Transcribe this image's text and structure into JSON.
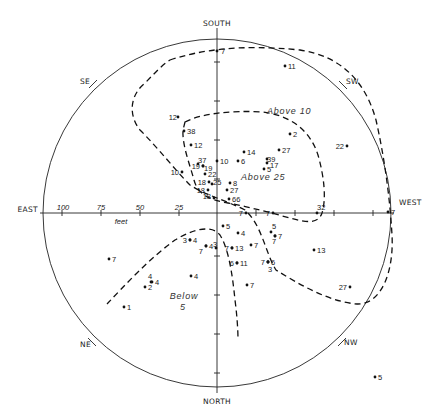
{
  "chart_data": {
    "type": "scatter",
    "title": "",
    "projection": "polar-compass",
    "center_px": [
      217,
      213
    ],
    "radius_px": 174,
    "directions": {
      "south": "SOUTH",
      "north": "NORTH",
      "east": "EAST",
      "west": "WEST",
      "se": "SE",
      "sw": "SW",
      "ne": "NE",
      "nw": "NW"
    },
    "scale": {
      "unit_label": "feet",
      "ticks": [
        "100",
        "75",
        "50",
        "25"
      ]
    },
    "contour_labels": {
      "above10": "Above 10",
      "above25": "Above 25",
      "below5_line1": "Below",
      "below5_line2": "5"
    },
    "points": [
      {
        "x": 217,
        "y": 51,
        "label": "7",
        "lx": 221,
        "ly": 54
      },
      {
        "x": 285,
        "y": 66,
        "label": "11",
        "lx": 288,
        "ly": 69
      },
      {
        "x": 178,
        "y": 117,
        "label": "12",
        "lx": 177,
        "ly": 120,
        "anchor": "end"
      },
      {
        "x": 184,
        "y": 131,
        "label": "38",
        "lx": 187,
        "ly": 134
      },
      {
        "x": 191,
        "y": 145,
        "label": "12",
        "lx": 194,
        "ly": 148
      },
      {
        "x": 290,
        "y": 134,
        "label": "2",
        "lx": 293,
        "ly": 137
      },
      {
        "x": 347,
        "y": 146,
        "label": "22",
        "lx": 344,
        "ly": 149,
        "anchor": "end"
      },
      {
        "x": 244,
        "y": 152,
        "label": "14",
        "lx": 247,
        "ly": 155
      },
      {
        "x": 279,
        "y": 150,
        "label": "27",
        "lx": 282,
        "ly": 153
      },
      {
        "x": 198,
        "y": 164,
        "label": "37",
        "lx": 198,
        "ly": 163
      },
      {
        "x": 217,
        "y": 161,
        "label": "10",
        "lx": 220,
        "ly": 164
      },
      {
        "x": 238,
        "y": 161,
        "label": "6",
        "lx": 241,
        "ly": 164
      },
      {
        "x": 267,
        "y": 159,
        "label": "39",
        "lx": 267,
        "ly": 162
      },
      {
        "x": 267,
        "y": 163,
        "label": "17",
        "lx": 270,
        "ly": 168
      },
      {
        "x": 203,
        "y": 166,
        "label": "19",
        "lx": 200,
        "ly": 169,
        "anchor": "end"
      },
      {
        "x": 203,
        "y": 166,
        "label": "19",
        "lx": 204,
        "ly": 171
      },
      {
        "x": 182,
        "y": 172,
        "label": "10",
        "lx": 179,
        "ly": 175,
        "anchor": "end"
      },
      {
        "x": 205,
        "y": 174,
        "label": "22",
        "lx": 208,
        "ly": 177
      },
      {
        "x": 264,
        "y": 169,
        "label": "5",
        "lx": 267,
        "ly": 172
      },
      {
        "x": 209,
        "y": 182,
        "label": "18",
        "lx": 206,
        "ly": 185,
        "anchor": "end"
      },
      {
        "x": 212,
        "y": 184,
        "label": "25",
        "lx": 213,
        "ly": 185
      },
      {
        "x": 230,
        "y": 183,
        "label": "8",
        "lx": 233,
        "ly": 186
      },
      {
        "x": 208,
        "y": 190,
        "label": "18",
        "lx": 205,
        "ly": 193,
        "anchor": "end"
      },
      {
        "x": 227,
        "y": 190,
        "label": "27",
        "lx": 230,
        "ly": 193
      },
      {
        "x": 214,
        "y": 198,
        "label": "18",
        "lx": 211,
        "ly": 199,
        "anchor": "end"
      },
      {
        "x": 229,
        "y": 199,
        "label": "66",
        "lx": 232,
        "ly": 202
      },
      {
        "x": 246,
        "y": 213,
        "label": "7",
        "lx": 243,
        "ly": 216,
        "anchor": "end"
      },
      {
        "x": 273,
        "y": 213,
        "label": "7",
        "lx": 270,
        "ly": 216,
        "anchor": "end"
      },
      {
        "x": 317,
        "y": 213,
        "label": "32",
        "lx": 317,
        "ly": 210
      },
      {
        "x": 388,
        "y": 212,
        "label": "7",
        "lx": 391,
        "ly": 215
      },
      {
        "x": 223,
        "y": 226,
        "label": "5",
        "lx": 226,
        "ly": 229
      },
      {
        "x": 238,
        "y": 233,
        "label": "4",
        "lx": 241,
        "ly": 236
      },
      {
        "x": 271,
        "y": 232,
        "label": "5",
        "lx": 272,
        "ly": 229
      },
      {
        "x": 275,
        "y": 236,
        "label": "7",
        "lx": 278,
        "ly": 239
      },
      {
        "x": 275,
        "y": 236,
        "label": "7",
        "lx": 272,
        "ly": 244
      },
      {
        "x": 190,
        "y": 240,
        "label": "3",
        "lx": 187,
        "ly": 243,
        "anchor": "end"
      },
      {
        "x": 190,
        "y": 240,
        "label": "4",
        "lx": 193,
        "ly": 243
      },
      {
        "x": 206,
        "y": 246,
        "label": "4",
        "lx": 209,
        "ly": 249
      },
      {
        "x": 206,
        "y": 246,
        "label": "7",
        "lx": 203,
        "ly": 254,
        "anchor": "end"
      },
      {
        "x": 216,
        "y": 248,
        "label": "3",
        "lx": 213,
        "ly": 247
      },
      {
        "x": 232,
        "y": 248,
        "label": "13",
        "lx": 235,
        "ly": 251
      },
      {
        "x": 232,
        "y": 248,
        "label": "7",
        "lx": 229,
        "ly": 251,
        "anchor": "end"
      },
      {
        "x": 251,
        "y": 245,
        "label": "7",
        "lx": 254,
        "ly": 248
      },
      {
        "x": 314,
        "y": 250,
        "label": "13",
        "lx": 317,
        "ly": 253
      },
      {
        "x": 237,
        "y": 263,
        "label": "11",
        "lx": 240,
        "ly": 266
      },
      {
        "x": 237,
        "y": 263,
        "label": "6",
        "lx": 234,
        "ly": 266,
        "anchor": "end"
      },
      {
        "x": 268,
        "y": 262,
        "label": "6",
        "lx": 271,
        "ly": 265
      },
      {
        "x": 268,
        "y": 262,
        "label": "7",
        "lx": 265,
        "ly": 265,
        "anchor": "end"
      },
      {
        "x": 268,
        "y": 262,
        "label": "3",
        "lx": 268,
        "ly": 272
      },
      {
        "x": 109,
        "y": 259,
        "label": "7",
        "lx": 112,
        "ly": 262
      },
      {
        "x": 191,
        "y": 276,
        "label": "4",
        "lx": 194,
        "ly": 279
      },
      {
        "x": 151,
        "y": 282,
        "label": "4",
        "lx": 148,
        "ly": 279
      },
      {
        "x": 152,
        "y": 282,
        "label": "4",
        "lx": 155,
        "ly": 285
      },
      {
        "x": 145,
        "y": 287,
        "label": "2",
        "lx": 148,
        "ly": 290
      },
      {
        "x": 247,
        "y": 285,
        "label": "7",
        "lx": 250,
        "ly": 288
      },
      {
        "x": 350,
        "y": 287,
        "label": "27",
        "lx": 347,
        "ly": 290,
        "anchor": "end"
      },
      {
        "x": 124,
        "y": 307,
        "label": "1",
        "lx": 127,
        "ly": 310
      },
      {
        "x": 375,
        "y": 377,
        "label": "5",
        "lx": 378,
        "ly": 380
      }
    ],
    "grid": false,
    "legend": "none"
  }
}
